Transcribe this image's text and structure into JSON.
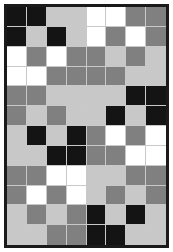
{
  "figure": {
    "columns": 8,
    "rows": 12,
    "frame_color": "#1a1a1a",
    "gridline_color": "#c9c9c9",
    "background_color": "#ffffff"
  },
  "palette": {
    "black": "#141414",
    "gray": "#808080",
    "lightgray": "#c8c8c8",
    "white": "#ffffff"
  },
  "chart_data": {
    "type": "heatmap",
    "xlabel": "",
    "ylabel": "",
    "categories": [
      "c1",
      "c2",
      "c3",
      "c4",
      "c5",
      "c6",
      "c7",
      "c8"
    ],
    "row_labels": [
      "r1",
      "r2",
      "r3",
      "r4",
      "r5",
      "r6",
      "r7",
      "r8",
      "r9",
      "r10",
      "r11",
      "r12"
    ],
    "value_names": [
      "black",
      "gray",
      "lightgray",
      "white"
    ],
    "value_colors": [
      "#141414",
      "#808080",
      "#c8c8c8",
      "#ffffff"
    ],
    "grid": true,
    "legend": "none",
    "cells": [
      [
        "black",
        "black",
        "lightgray",
        "lightgray",
        "white",
        "white",
        "gray",
        "gray"
      ],
      [
        "black",
        "lightgray",
        "black",
        "lightgray",
        "white",
        "gray",
        "white",
        "gray"
      ],
      [
        "white",
        "gray",
        "white",
        "gray",
        "gray",
        "lightgray",
        "gray",
        "lightgray"
      ],
      [
        "white",
        "white",
        "gray",
        "gray",
        "gray",
        "gray",
        "lightgray",
        "lightgray"
      ],
      [
        "gray",
        "gray",
        "lightgray",
        "lightgray",
        "lightgray",
        "lightgray",
        "black",
        "black"
      ],
      [
        "gray",
        "lightgray",
        "gray",
        "lightgray",
        "lightgray",
        "black",
        "lightgray",
        "black"
      ],
      [
        "lightgray",
        "black",
        "lightgray",
        "black",
        "gray",
        "white",
        "gray",
        "white"
      ],
      [
        "lightgray",
        "lightgray",
        "black",
        "black",
        "gray",
        "gray",
        "white",
        "white"
      ],
      [
        "gray",
        "gray",
        "white",
        "white",
        "lightgray",
        "lightgray",
        "gray",
        "gray"
      ],
      [
        "gray",
        "white",
        "gray",
        "white",
        "lightgray",
        "gray",
        "lightgray",
        "gray"
      ],
      [
        "lightgray",
        "gray",
        "lightgray",
        "gray",
        "black",
        "lightgray",
        "black",
        "lightgray"
      ],
      [
        "lightgray",
        "lightgray",
        "gray",
        "gray",
        "black",
        "black",
        "lightgray",
        "lightgray"
      ]
    ]
  }
}
